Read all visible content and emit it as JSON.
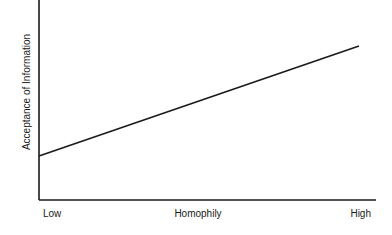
{
  "chart_data": {
    "type": "line",
    "title": "",
    "xlabel": "Homophily",
    "ylabel": "Acceptance of Information",
    "x_tick_labels": [
      "Low",
      "High"
    ],
    "x": [
      0,
      1
    ],
    "series": [
      {
        "name": "Acceptance of Information",
        "values": [
          0.22,
          0.77
        ]
      }
    ],
    "xlim": [
      0,
      1
    ],
    "ylim": [
      0,
      1
    ],
    "grid": false,
    "legend": "none",
    "line_color": "#1a1a1a"
  }
}
